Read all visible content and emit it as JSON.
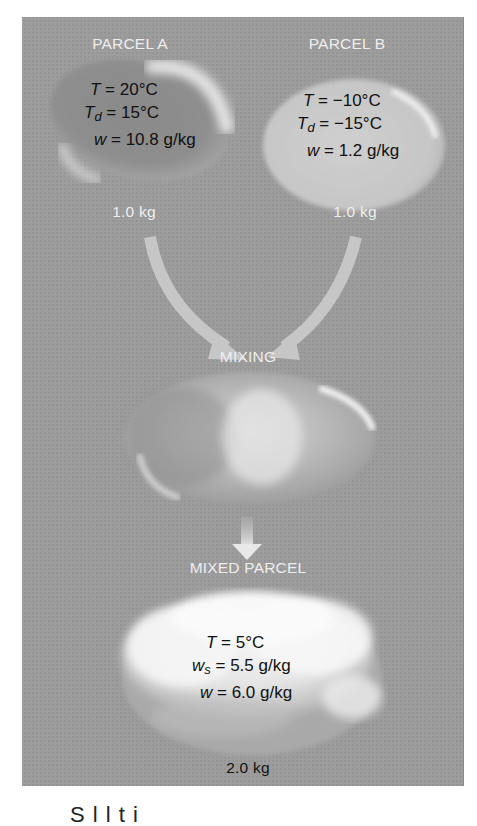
{
  "figure": {
    "parcel_a": {
      "title": "PARCEL A",
      "T_label": "T",
      "T_value": " = 20°C",
      "Td_label": "T",
      "Td_sub": "d",
      "Td_value": " = 15°C",
      "w_label": "w",
      "w_value": " = 10.8 g/kg",
      "mass": "1.0 kg"
    },
    "parcel_b": {
      "title": "PARCEL B",
      "T_label": "T",
      "T_value": " = −10°C",
      "Td_label": "T",
      "Td_sub": "d",
      "Td_value": " = −15°C",
      "w_label": "w",
      "w_value": " = 1.2 g/kg",
      "mass": "1.0 kg"
    },
    "mixing_label": "MIXING",
    "mixed_parcel": {
      "title": "MIXED PARCEL",
      "T_label": "T",
      "T_value": " = 5°C",
      "ws_label": "w",
      "ws_sub": "s",
      "ws_value": " = 5.5 g/kg",
      "w_label": "w",
      "w_value": " = 6.0 g/kg",
      "mass": "2.0 kg"
    },
    "caption_partial": "S                    l   l        t   i",
    "colors": {
      "panel": "#9c9c9c",
      "label_text": "#eeeeee",
      "value_text": "#111111",
      "arrow": "#c8c8c8"
    },
    "icons": [
      "curved-arrow-left-icon",
      "curved-arrow-right-icon",
      "down-arrow-icon"
    ]
  }
}
